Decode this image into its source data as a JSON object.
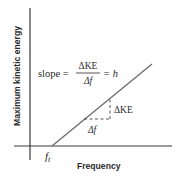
{
  "diagram": {
    "type": "graph",
    "y_axis_label": "Maximum kinetic energy",
    "x_axis_label": "Frequency",
    "threshold_label": "f",
    "threshold_subscript": "t",
    "slope_equation": {
      "prefix": "slope =",
      "numerator": "ΔKE",
      "denominator": "Δf",
      "suffix": "= h"
    },
    "delta_ke_label": "ΔKE",
    "delta_f_label": "Δf",
    "colors": {
      "axes": "#3a3a3a",
      "line": "#6e6e6e",
      "dashed": "#555555",
      "text": "#2a2a2a",
      "background": "#ffffff"
    }
  }
}
